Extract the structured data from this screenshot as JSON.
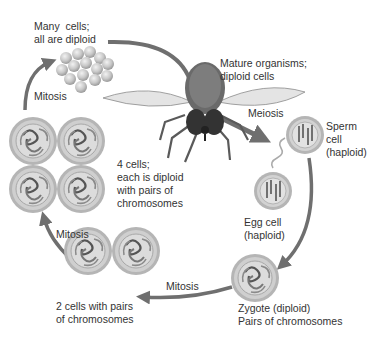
{
  "diagram": {
    "type": "life-cycle",
    "colors": {
      "arrow": "#6f6f6f",
      "cell_outer": "#a9a9a9",
      "cell_ring": "#c9c9c9",
      "cell_inner": "#d8d8d8",
      "text": "#333333"
    },
    "labels": {
      "many_cells": "Many  cells;\nall are diploid",
      "mature": "Mature organisms;\ndiploid cells",
      "meiosis": "Meiosis",
      "sperm": "Sperm\ncell\n(haploid)",
      "egg": "Egg cell\n(haploid)",
      "zygote": "Zygote (diploid)\nPairs of chromosomes",
      "mitosis_bottom": "Mitosis",
      "two_cells": "2 cells with pairs\nof chromosomes",
      "mitosis_left": "Mitosis",
      "four_cells": "4 cells;\neach is diploid\nwith pairs of\nchromosomes",
      "mitosis_top": "Mitosis"
    },
    "stages": [
      {
        "name": "Mature organisms",
        "ploidy": "diploid"
      },
      {
        "name": "Sperm cell",
        "ploidy": "haploid"
      },
      {
        "name": "Egg cell",
        "ploidy": "haploid"
      },
      {
        "name": "Zygote",
        "ploidy": "diploid"
      },
      {
        "name": "2 cells",
        "ploidy": "diploid"
      },
      {
        "name": "4 cells",
        "ploidy": "diploid"
      },
      {
        "name": "Many cells",
        "ploidy": "diploid"
      }
    ],
    "transitions": [
      "Meiosis",
      "Fertilization",
      "Mitosis",
      "Mitosis",
      "Mitosis",
      "Growth"
    ]
  }
}
